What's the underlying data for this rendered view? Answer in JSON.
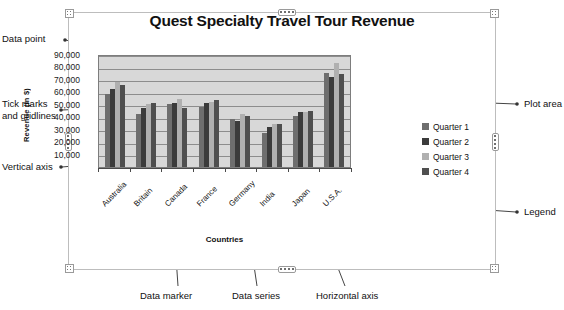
{
  "chart": {
    "title": "Quest Specialty Travel Tour Revenue",
    "x_axis_title": "Countries",
    "y_axis_title": "Revenue (in $)"
  },
  "chart_data": {
    "type": "bar",
    "title": "Quest Specialty Travel Tour Revenue",
    "xlabel": "Countries",
    "ylabel": "Revenue (in $)",
    "ylim": [
      0,
      90000
    ],
    "yticks": [
      "10,000",
      "20,000",
      "30,000",
      "40,000",
      "50,000",
      "60,000",
      "70,000",
      "80,000",
      "90,000"
    ],
    "ytick_values": [
      10000,
      20000,
      30000,
      40000,
      50000,
      60000,
      70000,
      80000,
      90000
    ],
    "grid": true,
    "legend_position": "right",
    "categories": [
      "Australia",
      "Britain",
      "Canada",
      "France",
      "Germany",
      "India",
      "Japan",
      "U.S.A."
    ],
    "series": [
      {
        "name": "Quarter 1",
        "color": "#6e6e6e",
        "values": [
          58000,
          42000,
          50000,
          48000,
          38000,
          27000,
          41000,
          75000
        ]
      },
      {
        "name": "Quarter 2",
        "color": "#3b3b3b",
        "values": [
          62000,
          47000,
          51000,
          51000,
          37000,
          32000,
          44000,
          72000
        ]
      },
      {
        "name": "Quarter 3",
        "color": "#b0b0b0",
        "values": [
          68000,
          50000,
          54000,
          52000,
          42000,
          34000,
          44000,
          83000
        ]
      },
      {
        "name": "Quarter 4",
        "color": "#4f4f4f",
        "values": [
          65000,
          51000,
          47000,
          53000,
          41000,
          34000,
          45000,
          74000
        ]
      }
    ]
  },
  "legend": {
    "items": [
      {
        "label": "Quarter 1",
        "color": "#6e6e6e"
      },
      {
        "label": "Quarter 2",
        "color": "#3b3b3b"
      },
      {
        "label": "Quarter 3",
        "color": "#b0b0b0"
      },
      {
        "label": "Quarter 4",
        "color": "#4f4f4f"
      }
    ]
  },
  "annotations": {
    "data_point": "Data point",
    "tick_marks": "Tick marks\nand gridlines",
    "vertical_axis": "Vertical axis",
    "plot_area": "Plot area",
    "legend": "Legend",
    "data_marker": "Data marker",
    "data_series": "Data series",
    "horizontal_axis": "Horizontal axis"
  }
}
